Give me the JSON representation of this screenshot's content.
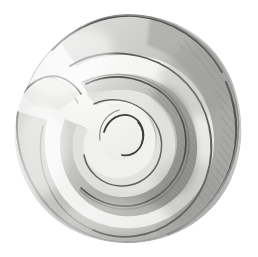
{
  "artwork": {
    "title": "Spiral Shell",
    "subject": "planispiral shell (nautilus / ammonite type)",
    "medium": "graphite pencil drawing",
    "orientation": "spiral coiling clockwise inward toward centre",
    "background_color": "#ffffff",
    "canvas": {
      "width": 258,
      "height": 257
    }
  },
  "palette": {
    "background": "#ffffff",
    "paper_tint": "#fbfbfb",
    "highlight_lightest": "#f7f7f6",
    "light_band": "#ededec",
    "mid_light": "#dededd",
    "mid_grey": "#c8c8c6",
    "mid_dark": "#b2b2b0",
    "shadow_grey": "#9a9a98",
    "deep_shadow": "#7d7d7b",
    "outline_dark": "#5c5c5a",
    "outline_darkest": "#3d3d3c",
    "hatch_stroke": "#6d6d6b"
  },
  "geometry": {
    "spiral_center": {
      "x": 120,
      "y": 133
    },
    "turns": 1.75,
    "outer_radius_max": 118,
    "inner_eye_radius": 14,
    "growth_factor": 0.33,
    "aperture_notch": {
      "x": 28,
      "y": 88,
      "description": "left-side notch where the outer whorl terminates at the aperture"
    }
  },
  "lighting": {
    "source": "upper left",
    "highlight_side": "left / lower-left",
    "shadow_side": "right / upper-right interior"
  },
  "features": [
    {
      "name": "outer-whorl",
      "description": "broad outermost body whorl sweeping from upper-left around the right and bottom",
      "tone": "light grey with dark upper rim"
    },
    {
      "name": "second-whorl",
      "description": "inner whorl band with strong cast shadow on its right flank",
      "tone": "mid to dark grey"
    },
    {
      "name": "inner-whorl",
      "description": "tight third coil approaching the centre",
      "tone": "light grey"
    },
    {
      "name": "spiral-eye",
      "description": "small hooked terminus at the very centre of the spiral",
      "tone": "dark outline on near-white"
    },
    {
      "name": "hatching",
      "description": "diagonal pencil hatch strokes along the shadowed right-hand flanks",
      "tone": "mid-dark grey strokes"
    },
    {
      "name": "aperture-notch",
      "description": "angular notch at the left edge where the shell mouth ends",
      "tone": "light grey with dark edge"
    }
  ],
  "labels": {
    "artboard": "Spiral Shell Drawing",
    "alt_text": "Pencil drawing of a coiled spiral shell rendered in soft grey tones on a white background."
  }
}
